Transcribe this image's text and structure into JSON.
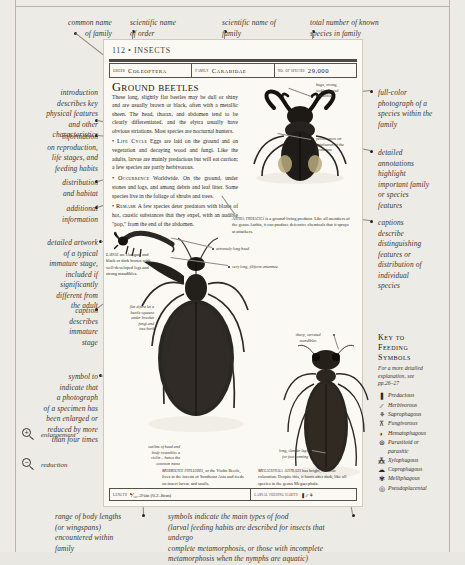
{
  "page": {
    "folio": "112 • INSECTS",
    "title": "Ground beetles"
  },
  "header": {
    "cells": [
      {
        "label": "Order",
        "value": "Coleoptera"
      },
      {
        "label": "Family",
        "value": "Carabidae"
      },
      {
        "label": "No. of species",
        "value": "29,000"
      }
    ]
  },
  "body": {
    "intro": "These long, slightly flat beetles may be dull or shiny and are usually brown or black, often with a metallic sheen. The head, thorax, and abdomen tend to be clearly differentiated, and the elytra usually have obvious striations. Most species are nocturnal hunters.",
    "sections": [
      {
        "head": "Life Cycle",
        "text": "Eggs are laid on the ground and on vegetation and decaying wood and fungi. Like the adults, larvae are mainly predacious but will eat carrion; a few species are partly herbivorous."
      },
      {
        "head": "Occurrence",
        "text": "Worldwide. On the ground, under stones and logs, and among debris and leaf litter. Some species live in the foliage of shrubs and trees."
      },
      {
        "head": "Remark",
        "text": "A few species deter predators with blasts of hot, caustic substances that they expel, with an audible \"pop,\" from the end of the abdomen."
      }
    ]
  },
  "footer": {
    "length_label": "Length",
    "length_value": "⅟₁₆–3⅛in (0.2–8cm)",
    "habits_label": "Larval feeding habits",
    "habits_symbols": "❚ ⁄⁄ ⚘"
  },
  "specimen_labels": [
    {
      "id": "mandibles",
      "text": "huge, strong,\nsickle-shaped\nmandibles"
    },
    {
      "id": "yellow-spots",
      "text": "yellow spots on\nepipleuron of the\npronotum"
    },
    {
      "id": "extremely-long-head",
      "text": "extremely long head"
    },
    {
      "id": "antennae",
      "text": "very long, filiform antennae"
    },
    {
      "id": "sharp-mandibles",
      "text": "sharp, serrated\nmandibles"
    },
    {
      "id": "slender-legs",
      "text": "long, slender legs\nfor fast running"
    },
    {
      "id": "flat-elytra",
      "text": "flat elytra let a\nbeetle squeeze\nunder bracket\nfungi and\ntree bark"
    },
    {
      "id": "violin-body",
      "text": "outline of head and\nbody resembles a\nviolin – hence the\ncommon name"
    }
  ],
  "captions": [
    {
      "id": "anthia",
      "name": "Anthia thoracica",
      "text": " is a ground-living predator. Like all members of the genus Anthia, it can produce defensive chemicals that it sprays at attackers."
    },
    {
      "id": "larvae",
      "name": "Larvae",
      "text": " are elongate and black or dark brown with well-developed legs and strong mandibles."
    },
    {
      "id": "mormolyce",
      "name": "Mormolyce phyllodes",
      "text": ", or the Violin Beetle, lives in the forests of Southeast Asia and feeds on insect larvae and snails."
    },
    {
      "id": "megacephala",
      "name": "Megacephala australis",
      "text": " has bright, metallic coloration. Despite this, it hunts after dark, like all species in the genus Megacephala."
    }
  ],
  "annotations_left": [
    {
      "id": "common-name",
      "text": "common name\nof family"
    },
    {
      "id": "introduction",
      "text": "introduction\ndescribes key\nphysical features\nand other\ncharacteristics"
    },
    {
      "id": "reproduction",
      "text": "information\non reproduction,\nlife stages, and\nfeeding habits"
    },
    {
      "id": "distribution",
      "text": "distribution\nand habitat"
    },
    {
      "id": "additional",
      "text": "additional\ninformation"
    },
    {
      "id": "artwork",
      "text": "detailed artwork\nof a typical\nimmature stage,\nincluded if\nsignificantly\ndifferent from\nthe adult"
    },
    {
      "id": "caption-immature",
      "text": "caption\ndescribes\nimmature\nstage"
    },
    {
      "id": "symbol",
      "text": "symbol to\nindicate that\na photograph\nof a specimen has\nbeen enlarged or\nreduced by more\nthan four times"
    }
  ],
  "annotations_top": [
    {
      "id": "scientific-order",
      "text": "scientific name\nof order"
    },
    {
      "id": "scientific-family",
      "text": "scientific name of\nfamily"
    },
    {
      "id": "species-count",
      "text": "total number of known\nspecies in family"
    }
  ],
  "annotations_right": [
    {
      "id": "photograph",
      "text": "full-color\nphotograph of a\nspecies within the\nfamily"
    },
    {
      "id": "detailed-annotations",
      "text": "detailed\nannotations\nhighlight\nimportant family\nor species\nfeatures"
    },
    {
      "id": "captions-describe",
      "text": "captions\ndescribe\ndistinguishing\nfeatures or\ndistribution of\nindividual\nspecies"
    }
  ],
  "annotations_bottom": [
    {
      "id": "body-lengths",
      "text": "range of body lengths\n(or wingspans)\nencountered within\nfamily"
    },
    {
      "id": "food-symbols",
      "text": "symbols indicate the main types of food\n(larval feeding habits are described for insects that undergo\ncomplete metamorphosis, or those with incomplete\nmetamorphosis when the nymphs are aquatic)"
    }
  ],
  "magnification": [
    {
      "id": "enlargement",
      "glyph": "+",
      "label": "enlargement"
    },
    {
      "id": "reduction",
      "glyph": "−",
      "label": "reduction"
    }
  ],
  "key": {
    "title": "Key to\nFeeding\nSymbols",
    "subtitle": "For a more detailed\nexplanation, see\npp.26–27",
    "items": [
      {
        "glyph": "❚",
        "label": "Predacious"
      },
      {
        "glyph": "⁄⁄",
        "label": "Herbivorous"
      },
      {
        "glyph": "⚘",
        "label": "Saprophagous"
      },
      {
        "glyph": "⊼",
        "label": "Fungivorous"
      },
      {
        "glyph": "◗",
        "label": "Hematophagous"
      },
      {
        "glyph": "⊛",
        "label": "Parasitoid or\nparasitic"
      },
      {
        "glyph": "⁂",
        "label": "Xylophagous"
      },
      {
        "glyph": "☁",
        "label": "Coprophagous"
      },
      {
        "glyph": "✾",
        "label": "Melliphagous"
      },
      {
        "glyph": "◎",
        "label": "Pseudoplacental"
      }
    ]
  },
  "colors": {
    "paper": "#edebe6",
    "book_paper": "#fbf9f4",
    "ink": "#2b2823",
    "rule": "#55514b"
  }
}
